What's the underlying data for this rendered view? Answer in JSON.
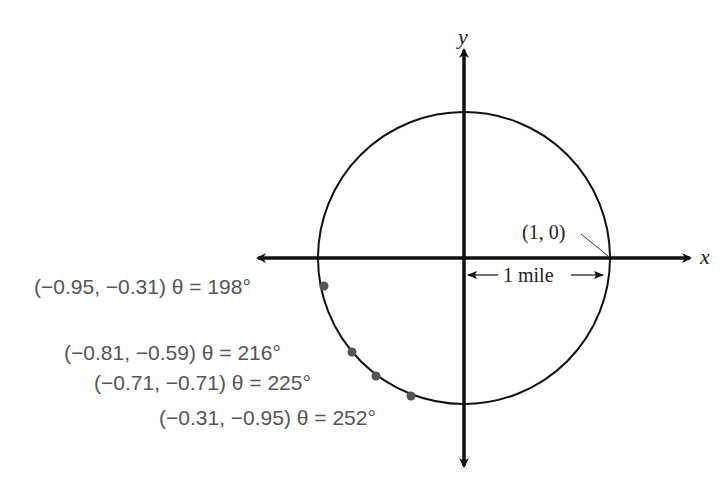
{
  "diagram": {
    "axes": {
      "x_label": "x",
      "y_label": "y"
    },
    "circle": {
      "center_px": [
        464,
        258
      ],
      "radius_px": 146
    },
    "reference_point": {
      "label": "(1, 0)"
    },
    "radius_label": "1 mile",
    "points": [
      {
        "coords": "(−0.95, −0.31)",
        "theta": "θ = 198°",
        "x": -0.95,
        "y": -0.31,
        "angle_deg": 198
      },
      {
        "coords": "(−0.81, −0.59)",
        "theta": "θ = 216°",
        "x": -0.81,
        "y": -0.59,
        "angle_deg": 216
      },
      {
        "coords": "(−0.71, −0.71)",
        "theta": "θ = 225°",
        "x": -0.71,
        "y": -0.71,
        "angle_deg": 225
      },
      {
        "coords": "(−0.31, −0.95)",
        "theta": "θ = 252°",
        "x": -0.31,
        "y": -0.95,
        "angle_deg": 252
      }
    ],
    "colors": {
      "lines": "#111111",
      "points": "#555555",
      "labels": "#555555"
    }
  }
}
